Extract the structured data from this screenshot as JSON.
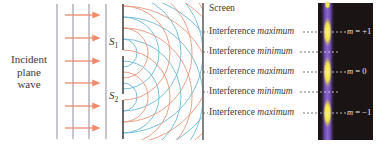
{
  "figure": {
    "incident_label": [
      "Incident",
      "plane",
      "wave"
    ],
    "slits": [
      {
        "letter": "S",
        "sub": "1"
      },
      {
        "letter": "S",
        "sub": "2"
      }
    ],
    "screen_label": "Screen",
    "fringes": [
      {
        "prefix": "Interference ",
        "kind": "maximum",
        "order_var": "m",
        "order_eq": " = +1"
      },
      {
        "prefix": "Interference ",
        "kind": "minimum",
        "order_var": "",
        "order_eq": ""
      },
      {
        "prefix": "Interference ",
        "kind": "maximum",
        "order_var": "m",
        "order_eq": " = 0"
      },
      {
        "prefix": "Interference ",
        "kind": "minimum",
        "order_var": "",
        "order_eq": ""
      },
      {
        "prefix": "Interference ",
        "kind": "maximum",
        "order_var": "m",
        "order_eq": " = −1"
      }
    ],
    "colors": {
      "wavefront_line": "#8a8d9a",
      "arrow": "#ef8a6a",
      "arc_blue": "#6ab8d8",
      "arc_orange": "#e8957a",
      "barrier": "#444444",
      "panel_bg": "#1a1414",
      "fringe_bright": "#f4ec5a",
      "fringe_dim": "#7a58b8"
    }
  }
}
